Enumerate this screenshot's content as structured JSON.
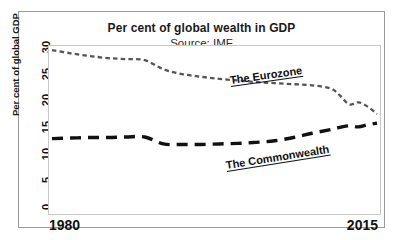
{
  "header": {
    "title": "Per cent of global wealth in GDP",
    "subtitle": "Source: IMF"
  },
  "axes": {
    "y_title": "Per cent of global GDP",
    "y_ticks": [
      "30",
      "25",
      "20",
      "15",
      "10",
      "5",
      "0"
    ],
    "x_start": "1980",
    "x_end": "2015"
  },
  "labels": {
    "eurozone": "The Eurozone",
    "commonwealth": "The Commonwealth"
  },
  "colors": {
    "eurozone_line": "#555555",
    "commonwealth_line": "#111111",
    "frame": "#9a9a9a",
    "plot_frame": "#c8c8c8",
    "text": "#111111"
  },
  "chart_data": {
    "type": "line",
    "title": "Per cent of global wealth in GDP",
    "subtitle": "Source: IMF",
    "xlabel": "",
    "ylabel": "Per cent of global GDP",
    "xlim": [
      1980,
      2015
    ],
    "ylim": [
      0,
      30
    ],
    "yticks": [
      0,
      5,
      10,
      15,
      20,
      25,
      30
    ],
    "xticks": [
      1980,
      2015
    ],
    "grid": false,
    "legend": "inline-annotations",
    "series": [
      {
        "name": "The Eurozone",
        "style": "short-dashed",
        "x": [
          1980,
          1982,
          1984,
          1986,
          1988,
          1990,
          1992,
          1994,
          1996,
          1998,
          2000,
          2002,
          2004,
          2006,
          2008,
          2010,
          2011,
          2012,
          2013,
          2014,
          2015
        ],
        "values": [
          29.8,
          29.2,
          28.7,
          28.3,
          28.1,
          27.9,
          26.2,
          25.3,
          24.8,
          24.4,
          24.1,
          23.8,
          23.6,
          23.4,
          23.2,
          22.6,
          21.3,
          19.6,
          20.0,
          19.2,
          17.8
        ]
      },
      {
        "name": "The Commonwealth",
        "style": "long-dashed",
        "x": [
          1980,
          1982,
          1984,
          1986,
          1988,
          1990,
          1992,
          1994,
          1996,
          1998,
          2000,
          2002,
          2004,
          2006,
          2008,
          2010,
          2011,
          2012,
          2013,
          2014,
          2015
        ],
        "values": [
          13.2,
          13.3,
          13.4,
          13.4,
          13.5,
          13.5,
          12.2,
          12.1,
          12.1,
          12.2,
          12.3,
          12.5,
          12.8,
          13.4,
          14.2,
          14.9,
          15.3,
          15.6,
          15.4,
          15.8,
          16.1
        ]
      }
    ]
  }
}
